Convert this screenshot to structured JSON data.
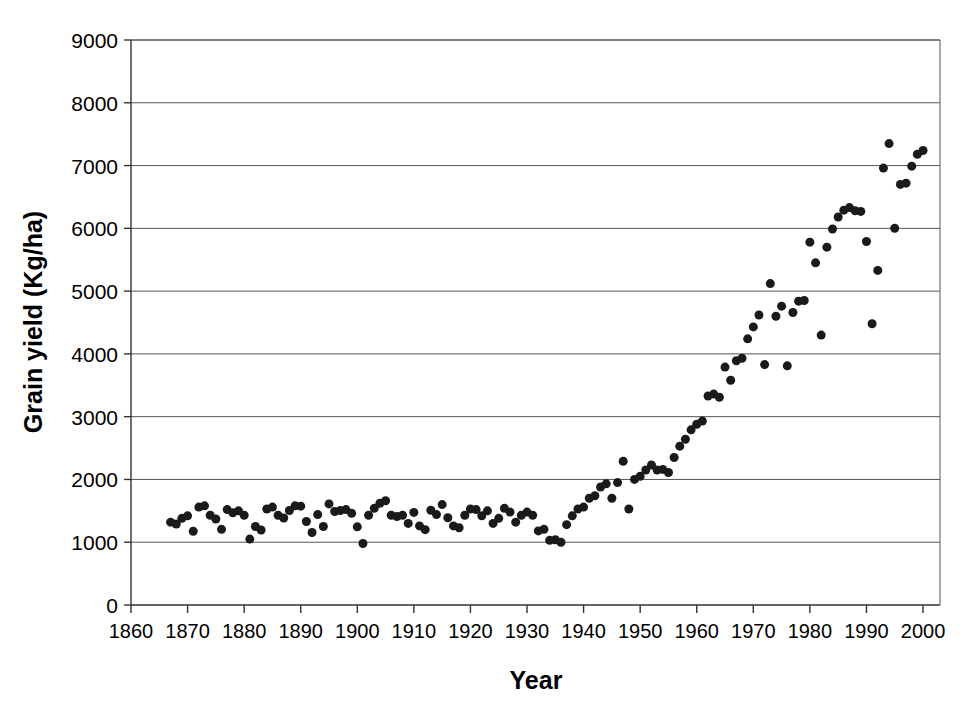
{
  "chart_data": {
    "type": "scatter",
    "title": "",
    "xlabel": "Year",
    "ylabel": "Grain yield (Kg/ha)",
    "xlim": [
      1860,
      2003
    ],
    "ylim": [
      0,
      9000
    ],
    "xticks": [
      1860,
      1870,
      1880,
      1890,
      1900,
      1910,
      1920,
      1930,
      1940,
      1950,
      1960,
      1970,
      1980,
      1990,
      2000
    ],
    "yticks": [
      0,
      1000,
      2000,
      3000,
      4000,
      5000,
      6000,
      7000,
      8000,
      9000
    ],
    "grid": "horizontal",
    "legend": "none",
    "marker": {
      "shape": "circle",
      "color": "#1a1a1a",
      "size_px": 9
    },
    "series": [
      {
        "name": "Grain yield",
        "points": [
          [
            1867,
            1320
          ],
          [
            1868,
            1290
          ],
          [
            1869,
            1380
          ],
          [
            1870,
            1420
          ],
          [
            1871,
            1175
          ],
          [
            1872,
            1560
          ],
          [
            1873,
            1580
          ],
          [
            1874,
            1430
          ],
          [
            1875,
            1370
          ],
          [
            1876,
            1205
          ],
          [
            1877,
            1520
          ],
          [
            1878,
            1470
          ],
          [
            1879,
            1500
          ],
          [
            1880,
            1430
          ],
          [
            1881,
            1050
          ],
          [
            1882,
            1250
          ],
          [
            1883,
            1195
          ],
          [
            1884,
            1530
          ],
          [
            1885,
            1560
          ],
          [
            1886,
            1430
          ],
          [
            1887,
            1385
          ],
          [
            1888,
            1505
          ],
          [
            1889,
            1580
          ],
          [
            1890,
            1575
          ],
          [
            1891,
            1330
          ],
          [
            1892,
            1155
          ],
          [
            1893,
            1440
          ],
          [
            1894,
            1250
          ],
          [
            1895,
            1610
          ],
          [
            1896,
            1490
          ],
          [
            1897,
            1505
          ],
          [
            1898,
            1520
          ],
          [
            1899,
            1460
          ],
          [
            1900,
            1245
          ],
          [
            1901,
            980
          ],
          [
            1902,
            1430
          ],
          [
            1903,
            1540
          ],
          [
            1904,
            1620
          ],
          [
            1905,
            1660
          ],
          [
            1906,
            1430
          ],
          [
            1907,
            1410
          ],
          [
            1908,
            1430
          ],
          [
            1909,
            1300
          ],
          [
            1910,
            1475
          ],
          [
            1911,
            1260
          ],
          [
            1912,
            1200
          ],
          [
            1913,
            1510
          ],
          [
            1914,
            1440
          ],
          [
            1915,
            1600
          ],
          [
            1916,
            1390
          ],
          [
            1917,
            1260
          ],
          [
            1918,
            1230
          ],
          [
            1919,
            1430
          ],
          [
            1920,
            1530
          ],
          [
            1921,
            1520
          ],
          [
            1922,
            1420
          ],
          [
            1923,
            1500
          ],
          [
            1924,
            1300
          ],
          [
            1925,
            1380
          ],
          [
            1926,
            1540
          ],
          [
            1927,
            1480
          ],
          [
            1928,
            1320
          ],
          [
            1929,
            1430
          ],
          [
            1930,
            1480
          ],
          [
            1931,
            1430
          ],
          [
            1932,
            1180
          ],
          [
            1933,
            1205
          ],
          [
            1934,
            1030
          ],
          [
            1935,
            1040
          ],
          [
            1936,
            1000
          ],
          [
            1937,
            1280
          ],
          [
            1938,
            1420
          ],
          [
            1939,
            1530
          ],
          [
            1940,
            1560
          ],
          [
            1941,
            1700
          ],
          [
            1942,
            1740
          ],
          [
            1943,
            1880
          ],
          [
            1944,
            1930
          ],
          [
            1945,
            1700
          ],
          [
            1946,
            1950
          ],
          [
            1947,
            2290
          ],
          [
            1948,
            1530
          ],
          [
            1949,
            2000
          ],
          [
            1950,
            2050
          ],
          [
            1951,
            2150
          ],
          [
            1952,
            2230
          ],
          [
            1953,
            2150
          ],
          [
            1954,
            2160
          ],
          [
            1955,
            2110
          ],
          [
            1956,
            2350
          ],
          [
            1957,
            2530
          ],
          [
            1958,
            2640
          ],
          [
            1959,
            2790
          ],
          [
            1960,
            2880
          ],
          [
            1961,
            2930
          ],
          [
            1962,
            3330
          ],
          [
            1963,
            3360
          ],
          [
            1964,
            3310
          ],
          [
            1965,
            3790
          ],
          [
            1966,
            3580
          ],
          [
            1967,
            3890
          ],
          [
            1968,
            3930
          ],
          [
            1969,
            4240
          ],
          [
            1970,
            4430
          ],
          [
            1971,
            4620
          ],
          [
            1972,
            3830
          ],
          [
            1973,
            5120
          ],
          [
            1974,
            4600
          ],
          [
            1975,
            4760
          ],
          [
            1976,
            3810
          ],
          [
            1977,
            4660
          ],
          [
            1978,
            4840
          ],
          [
            1979,
            4850
          ],
          [
            1980,
            5780
          ],
          [
            1981,
            5450
          ],
          [
            1982,
            4300
          ],
          [
            1983,
            5700
          ],
          [
            1984,
            5990
          ],
          [
            1985,
            6180
          ],
          [
            1986,
            6290
          ],
          [
            1987,
            6330
          ],
          [
            1988,
            6280
          ],
          [
            1989,
            6270
          ],
          [
            1990,
            5790
          ],
          [
            1991,
            4480
          ],
          [
            1992,
            5330
          ],
          [
            1993,
            6960
          ],
          [
            1994,
            7350
          ],
          [
            1995,
            6000
          ],
          [
            1996,
            6700
          ],
          [
            1997,
            6720
          ],
          [
            1998,
            6990
          ],
          [
            1999,
            7180
          ],
          [
            2000,
            7240
          ]
        ]
      }
    ]
  }
}
